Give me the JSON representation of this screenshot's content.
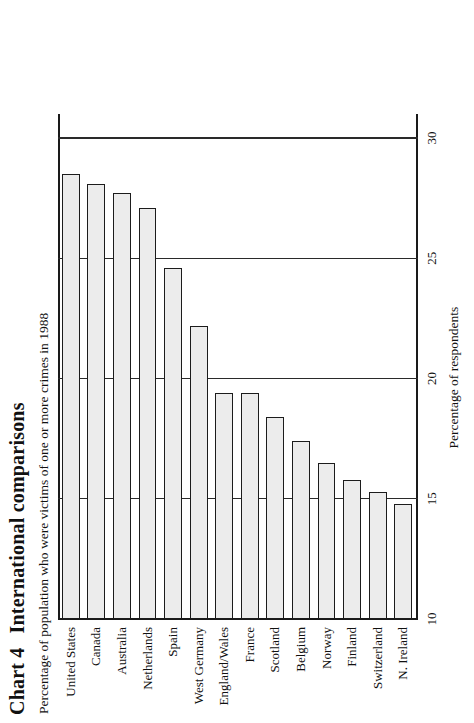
{
  "figure": {
    "chart_number": "Chart 4",
    "title": "International comparisons",
    "subtitle": "Percentage of population who were victims of one or more crimes in 1988",
    "axis_title": "Percentage of respondents",
    "bar_fill_color": "#ececec",
    "bar_edge_color": "#1c1c1c",
    "grid_color": "#2a2a2a"
  },
  "chart_data": {
    "type": "bar",
    "subtitle": "Percentage of population who were victims of one or more crimes in 1988",
    "orientation": "vertical",
    "xlabel": "",
    "ylabel": "Percentage of respondents",
    "ylim": [
      10,
      31
    ],
    "yticks": [
      10,
      15,
      20,
      25,
      30
    ],
    "ytick_labels": [
      "10",
      "15",
      "20",
      "25",
      "30"
    ],
    "grid": true,
    "legend": false,
    "categories": [
      "United States",
      "Canada",
      "Australia",
      "Netherlands",
      "Spain",
      "West Germany",
      "England/Wales",
      "France",
      "Scotland",
      "Belgium",
      "Norway",
      "Finland",
      "Switzerland",
      "N. Ireland"
    ],
    "values": [
      28.5,
      28.1,
      27.7,
      27.1,
      24.6,
      22.2,
      19.4,
      19.4,
      18.4,
      17.4,
      16.5,
      15.8,
      15.3,
      14.8
    ]
  }
}
